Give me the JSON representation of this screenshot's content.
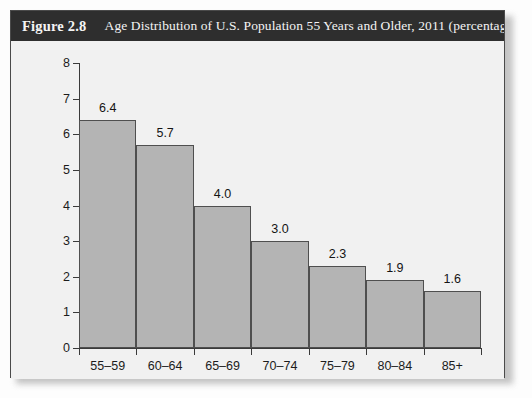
{
  "figure": {
    "number_label": "Figure 2.8",
    "caption": "Age Distribution of U.S. Population 55 Years and Older, 2011 (percentages)"
  },
  "colors": {
    "header_bg": "#2e2e2e",
    "header_text": "#f4f4f4",
    "panel_bg": "#f1f1f1",
    "bar_fill": "#b4b4b4",
    "bar_stroke": "#4f4f4f",
    "axis": "#3a3a3a",
    "page_bg": "#fdfdfd"
  },
  "chart_data": {
    "type": "bar",
    "title": "Age Distribution of U.S. Population 55 Years and Older, 2011 (percentages)",
    "categories": [
      "55–59",
      "60–64",
      "65–69",
      "70–74",
      "75–79",
      "80–84",
      "85+"
    ],
    "values": [
      6.4,
      5.7,
      4.0,
      3.0,
      2.3,
      1.9,
      1.6
    ],
    "value_labels": [
      "6.4",
      "5.7",
      "4.0",
      "3.0",
      "2.3",
      "1.9",
      "1.6"
    ],
    "xlabel": "",
    "ylabel": "",
    "ylim": [
      0,
      8
    ],
    "ytick_labels": [
      "0",
      "1",
      "2",
      "3",
      "4",
      "5",
      "6",
      "7",
      "8"
    ],
    "yticks": [
      0,
      1,
      2,
      3,
      4,
      5,
      6,
      7,
      8
    ],
    "grid": false,
    "legend": false
  }
}
